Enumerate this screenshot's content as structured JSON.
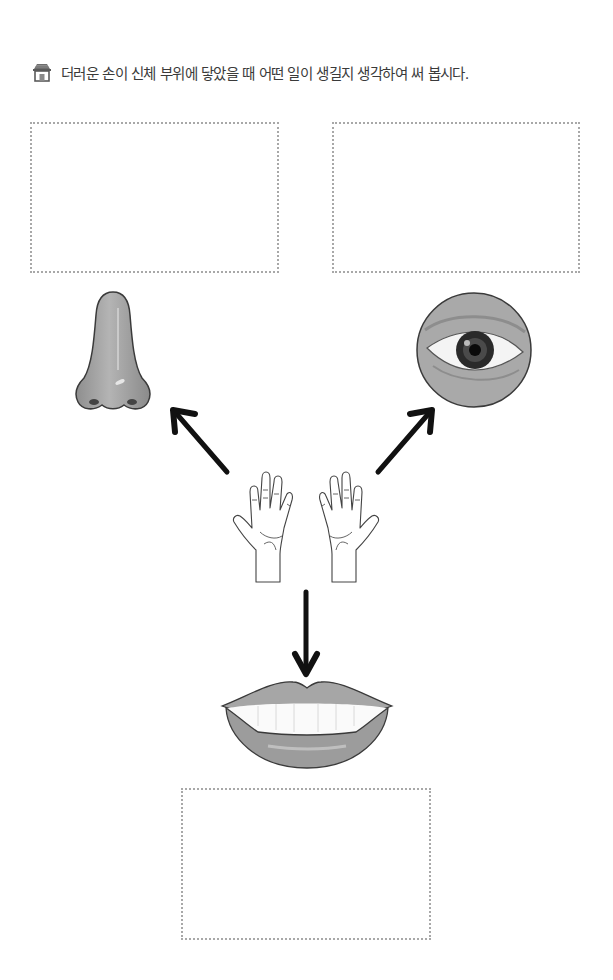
{
  "instruction": {
    "icon": "house-icon",
    "text": "더러운 손이 신체 부위에 닿았을 때 어떤 일이 생길지 생각하여 써 봅시다."
  },
  "answer_boxes": [
    {
      "id": "nose",
      "label": "",
      "placeholder": ""
    },
    {
      "id": "eye",
      "label": "",
      "placeholder": ""
    },
    {
      "id": "mouth",
      "label": "",
      "placeholder": ""
    }
  ],
  "illustrations": {
    "center": "dirty-hands-icon",
    "targets": [
      "nose-icon",
      "eye-icon",
      "lips-icon"
    ]
  },
  "colors": {
    "dotted_border": "#a8a8a8",
    "illustration_gray": "#9e9e9e",
    "arrow": "#111111"
  }
}
